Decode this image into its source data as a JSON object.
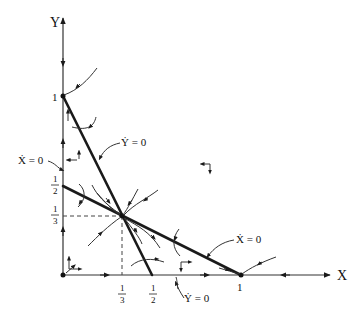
{
  "diagram": {
    "type": "phase-plane",
    "axes": {
      "x_label": "X",
      "y_label": "Y"
    },
    "ticks": {
      "x": [
        {
          "num": "1",
          "den": "3"
        },
        {
          "num": "1",
          "den": "2"
        },
        {
          "label": "1"
        }
      ],
      "y": [
        {
          "label": "1"
        },
        {
          "num": "1",
          "den": "2"
        },
        {
          "num": "1",
          "den": "3"
        }
      ]
    },
    "nullclines": {
      "y_dot_zero_top": "Ẏ = 0",
      "x_dot_zero_left": "Ẋ = 0",
      "x_dot_zero_right": "Ẋ = 0",
      "y_dot_zero_bottom": "Ẏ = 0"
    },
    "equilibria": [
      {
        "name": "origin",
        "x": 0,
        "y": 0
      },
      {
        "name": "x-axis",
        "x": 1,
        "y": 0
      },
      {
        "name": "y-axis",
        "x": 0,
        "y": 1
      },
      {
        "name": "interior",
        "x": "1/3",
        "y": "1/3"
      }
    ],
    "nullcline_lines": [
      {
        "name": "Y-dot nullcline",
        "from": [
          0,
          1
        ],
        "to": [
          "1/2",
          0
        ]
      },
      {
        "name": "X-dot nullcline",
        "from": [
          0,
          "1/2"
        ],
        "to": [
          1,
          0
        ]
      }
    ]
  }
}
